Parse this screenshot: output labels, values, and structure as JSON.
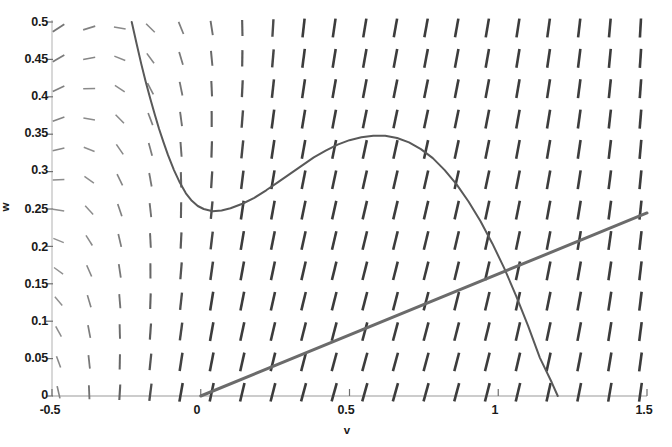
{
  "chart_data": {
    "type": "line",
    "title": "",
    "subtitle": "",
    "xlabel": "v",
    "ylabel": "w",
    "xlim": [
      -0.5,
      1.5
    ],
    "ylim": [
      0,
      0.5
    ],
    "grid": false,
    "legend": null,
    "xticks": [
      -0.5,
      0,
      0.5,
      1,
      1.5
    ],
    "xticklabels": [
      "-0.5",
      "0",
      "0.5",
      "1",
      "1.5"
    ],
    "yticks": [
      0,
      0.05,
      0.1,
      0.15,
      0.2,
      0.25,
      0.3,
      0.35,
      0.4,
      0.45,
      0.5
    ],
    "yticklabels": [
      "0",
      "0.05",
      "0.1",
      "0.15",
      "0.2",
      "0.25",
      "0.3",
      "0.35",
      "0.4",
      "0.45",
      "0.5"
    ],
    "series": [
      {
        "name": "v-nullcline (cubic)",
        "type": "line",
        "color": "#595959",
        "linewidth": 2.0,
        "points": [
          [
            -0.232,
            0.5
          ],
          [
            -0.215,
            0.47
          ],
          [
            -0.2,
            0.444
          ],
          [
            -0.185,
            0.42
          ],
          [
            -0.17,
            0.398
          ],
          [
            -0.155,
            0.377
          ],
          [
            -0.14,
            0.357
          ],
          [
            -0.125,
            0.339
          ],
          [
            -0.11,
            0.322
          ],
          [
            -0.09,
            0.302
          ],
          [
            -0.07,
            0.285
          ],
          [
            -0.05,
            0.271
          ],
          [
            -0.03,
            0.261
          ],
          [
            -0.01,
            0.254
          ],
          [
            0.01,
            0.25
          ],
          [
            0.04,
            0.247
          ],
          [
            0.07,
            0.248
          ],
          [
            0.1,
            0.251
          ],
          [
            0.14,
            0.257
          ],
          [
            0.18,
            0.265
          ],
          [
            0.22,
            0.275
          ],
          [
            0.26,
            0.286
          ],
          [
            0.3,
            0.297
          ],
          [
            0.34,
            0.308
          ],
          [
            0.38,
            0.319
          ],
          [
            0.42,
            0.328
          ],
          [
            0.46,
            0.336
          ],
          [
            0.5,
            0.342
          ],
          [
            0.54,
            0.346
          ],
          [
            0.58,
            0.348
          ],
          [
            0.62,
            0.348
          ],
          [
            0.66,
            0.345
          ],
          [
            0.7,
            0.339
          ],
          [
            0.74,
            0.33
          ],
          [
            0.78,
            0.318
          ],
          [
            0.82,
            0.302
          ],
          [
            0.86,
            0.283
          ],
          [
            0.9,
            0.26
          ],
          [
            0.94,
            0.234
          ],
          [
            0.98,
            0.204
          ],
          [
            1.02,
            0.171
          ],
          [
            1.06,
            0.134
          ],
          [
            1.1,
            0.094
          ],
          [
            1.14,
            0.051
          ],
          [
            1.18,
            0.018
          ],
          [
            1.2,
            0.0
          ]
        ]
      },
      {
        "name": "w-nullcline (line)",
        "type": "line",
        "color": "#6b6b6b",
        "linewidth": 3.0,
        "points": [
          [
            0.0,
            0.0
          ],
          [
            1.5,
            0.2447
          ]
        ]
      }
    ],
    "vector_field": {
      "name": "direction field",
      "color": "#4d4d4d",
      "grid_cols": 20,
      "grid_rows": 13,
      "x_range": [
        -0.478,
        1.478
      ],
      "y_range": [
        0.005,
        0.492
      ],
      "description": "FitzHugh-Nagumo style direction field: arrows rotate from up-right at high w through steeply down-right near the cubic nullcline to nearly horizontal rightward at low w"
    },
    "annotations": []
  },
  "axes": {
    "x_axis_name": "v-axis",
    "y_axis_name": "w-axis"
  }
}
